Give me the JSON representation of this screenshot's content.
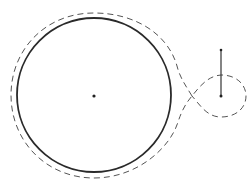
{
  "diagram": {
    "type": "geometric-figure",
    "colors": {
      "background": "#ffffff",
      "stroke": "#2a2a2a",
      "dashed": "#555555"
    },
    "main_circle": {
      "cx": 94,
      "cy": 95,
      "rx": 77,
      "ry": 77,
      "style": "solid"
    },
    "center_point": {
      "cx": 94,
      "cy": 96,
      "r": 1.6
    },
    "outer_dashed_curve": {
      "style": "dashed",
      "description": "envelope around main circle forming a loop on the right"
    },
    "small_loop": {
      "cx": 221,
      "cy": 96,
      "rx": 25,
      "ry": 21,
      "style": "dashed"
    },
    "vector": {
      "x1": 221,
      "y1": 50,
      "x2": 221,
      "y2": 96
    },
    "vector_points": [
      {
        "cx": 221,
        "cy": 50
      },
      {
        "cx": 221,
        "cy": 96
      }
    ],
    "crossing_point": {
      "x": 192,
      "y": 96
    }
  }
}
